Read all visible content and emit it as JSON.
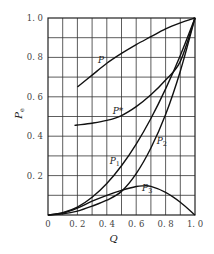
{
  "chart_data": {
    "type": "line",
    "title": "",
    "xlabel": "Q",
    "ylabel": "Pe",
    "ylabel_main": "P",
    "ylabel_sub": "e",
    "xlim": [
      0,
      1.0
    ],
    "ylim": [
      0,
      1.0
    ],
    "grid": true,
    "grid_step": 0.1,
    "legend": "none (inline curve labels)",
    "x_ticks": [
      "0",
      "0.2",
      "0.4",
      "0.6",
      "0.8",
      "1.0"
    ],
    "y_ticks": [
      "0.2",
      "0.4",
      "0.6",
      "0.8",
      "1.0"
    ],
    "series": [
      {
        "name": "P",
        "label_main": "P",
        "label_sub": "",
        "label_pos": [
          0.34,
          0.77
        ],
        "x": [
          0.2,
          0.3,
          0.4,
          0.5,
          0.6,
          0.7,
          0.8,
          0.9,
          1.0
        ],
        "y": [
          0.65,
          0.71,
          0.77,
          0.82,
          0.865,
          0.905,
          0.945,
          0.975,
          1.0
        ]
      },
      {
        "name": "P*",
        "label_main": "P*",
        "label_sub": "",
        "label_pos": [
          0.44,
          0.515
        ],
        "x": [
          0.18,
          0.2,
          0.3,
          0.4,
          0.5,
          0.6,
          0.7,
          0.8,
          0.9,
          1.0
        ],
        "y": [
          0.455,
          0.457,
          0.466,
          0.48,
          0.505,
          0.55,
          0.61,
          0.685,
          0.78,
          1.0
        ]
      },
      {
        "name": "P1",
        "label_main": "P",
        "label_sub": "1",
        "label_pos": [
          0.42,
          0.26
        ],
        "x": [
          0,
          0.1,
          0.2,
          0.3,
          0.4,
          0.5,
          0.6,
          0.7,
          0.8,
          0.9,
          1.0
        ],
        "y": [
          0,
          0.012,
          0.04,
          0.09,
          0.16,
          0.25,
          0.36,
          0.49,
          0.64,
          0.81,
          1.0
        ]
      },
      {
        "name": "P2",
        "label_main": "P",
        "label_sub": "2",
        "label_pos": [
          0.74,
          0.36
        ],
        "x": [
          0,
          0.1,
          0.2,
          0.3,
          0.4,
          0.5,
          0.6,
          0.7,
          0.8,
          0.9,
          1.0
        ],
        "y": [
          0,
          0.006,
          0.02,
          0.045,
          0.075,
          0.12,
          0.21,
          0.34,
          0.51,
          0.73,
          1.0
        ]
      },
      {
        "name": "P3",
        "label_main": "P",
        "label_sub": "3",
        "label_pos": [
          0.64,
          0.12
        ],
        "x": [
          0,
          0.1,
          0.2,
          0.3,
          0.4,
          0.5,
          0.6,
          0.65,
          0.7,
          0.8,
          0.9,
          1.0
        ],
        "y": [
          0,
          0.01,
          0.035,
          0.07,
          0.1,
          0.125,
          0.145,
          0.148,
          0.145,
          0.115,
          0.065,
          0.0
        ]
      }
    ]
  }
}
